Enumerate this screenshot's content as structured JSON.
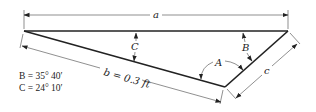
{
  "diagram": {
    "labels": {
      "a": "a",
      "b": "b = 0.3 ft",
      "c": "c",
      "A": "A",
      "B": "B",
      "C": "C"
    },
    "given": {
      "B": "B = 35° 40′",
      "C": "C = 24° 10′"
    },
    "colors": {
      "line": "#222222",
      "background": "#ffffff"
    }
  }
}
